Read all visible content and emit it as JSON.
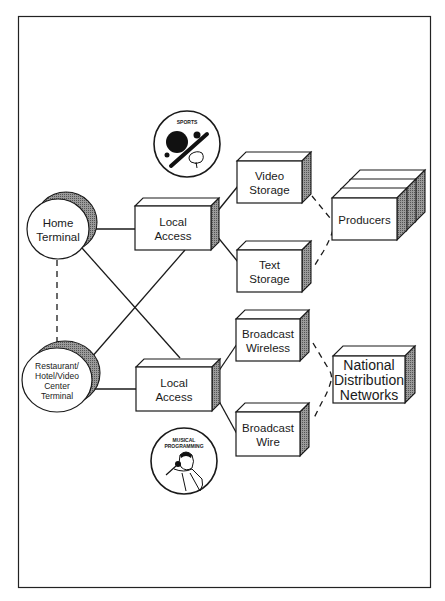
{
  "diagram": {
    "type": "network-architecture",
    "colors": {
      "ink": "#1a1a1a",
      "shade": "#8a8a8a",
      "background": "#ffffff"
    },
    "nodes": {
      "home_terminal": {
        "lines": [
          "Home",
          "Terminal"
        ],
        "shape": "ellipse-terminal"
      },
      "restaurant_terminal": {
        "lines": [
          "Restaurant/",
          "Hotel/Video",
          "Center",
          "Terminal"
        ],
        "shape": "ellipse-terminal"
      },
      "local_access_top": {
        "lines": [
          "Local",
          "Access"
        ],
        "shape": "box"
      },
      "local_access_bottom": {
        "lines": [
          "Local",
          "Access"
        ],
        "shape": "box"
      },
      "video_storage": {
        "lines": [
          "Video",
          "Storage"
        ],
        "shape": "box"
      },
      "text_storage": {
        "lines": [
          "Text",
          "Storage"
        ],
        "shape": "box"
      },
      "broadcast_wireless": {
        "lines": [
          "Broadcast",
          "Wireless"
        ],
        "shape": "box"
      },
      "broadcast_wire": {
        "lines": [
          "Broadcast",
          "Wire"
        ],
        "shape": "box"
      },
      "producers": {
        "lines": [
          "Producers"
        ],
        "shape": "stacked-box"
      },
      "national_distribution_networks": {
        "lines": [
          "National",
          "Distribution",
          "Networks"
        ],
        "shape": "box"
      }
    },
    "icons": {
      "sports": {
        "caption": "SPORTS",
        "semantic": "sports-icon"
      },
      "music": {
        "caption_lines": [
          "MUSICAL",
          "PROGRAMMING"
        ],
        "semantic": "musical-programming-icon"
      }
    },
    "edges": [
      {
        "from": "home_terminal",
        "to": "local_access_top",
        "style": "solid"
      },
      {
        "from": "home_terminal",
        "to": "local_access_bottom",
        "style": "solid"
      },
      {
        "from": "restaurant_terminal",
        "to": "local_access_top",
        "style": "solid"
      },
      {
        "from": "restaurant_terminal",
        "to": "local_access_bottom",
        "style": "solid"
      },
      {
        "from": "home_terminal",
        "to": "restaurant_terminal",
        "style": "dashed"
      },
      {
        "from": "local_access_top",
        "to": "video_storage",
        "style": "solid"
      },
      {
        "from": "local_access_top",
        "to": "text_storage",
        "style": "solid"
      },
      {
        "from": "local_access_bottom",
        "to": "broadcast_wireless",
        "style": "solid"
      },
      {
        "from": "local_access_bottom",
        "to": "broadcast_wire",
        "style": "solid"
      },
      {
        "from": "video_storage",
        "to": "producers",
        "style": "dashed"
      },
      {
        "from": "text_storage",
        "to": "producers",
        "style": "dashed"
      },
      {
        "from": "broadcast_wireless",
        "to": "national_distribution_networks",
        "style": "dashed"
      },
      {
        "from": "broadcast_wire",
        "to": "national_distribution_networks",
        "style": "dashed"
      }
    ]
  }
}
